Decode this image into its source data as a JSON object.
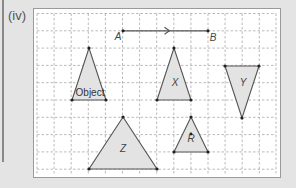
{
  "part_label": "(iv)",
  "colors": {
    "background": "#e4e4e4",
    "card": "#ffffff",
    "grid": "#a8a8a8",
    "shape_fill": "#e3e3e3",
    "shape_stroke": "#555555",
    "vertex": "#222222"
  },
  "grid": {
    "x0": 37,
    "y0": 13.5,
    "dx": 17.1,
    "dy": 17.3,
    "cols": 14,
    "rows": 9,
    "x_end": 276,
    "y_end": 175
  },
  "vector": {
    "start_label": "A",
    "end_label": "B",
    "start": [
      123,
      30.8
    ],
    "end": [
      208,
      30.8
    ]
  },
  "shapes": [
    {
      "name": "Object",
      "label": "Object",
      "points": [
        [
          89,
          48
        ],
        [
          72,
          100
        ],
        [
          106,
          100
        ]
      ],
      "label_pos": [
        90,
        96
      ],
      "italic": false
    },
    {
      "name": "X",
      "label": "X",
      "points": [
        [
          174,
          48
        ],
        [
          157,
          100
        ],
        [
          191,
          100
        ]
      ],
      "label_pos": [
        175,
        86
      ],
      "italic": true
    },
    {
      "name": "Y",
      "label": "Y",
      "points": [
        [
          225,
          66
        ],
        [
          259,
          66
        ],
        [
          242,
          118
        ]
      ],
      "label_pos": [
        243,
        86
      ],
      "italic": true
    },
    {
      "name": "Z",
      "label": "Z",
      "points": [
        [
          123,
          117
        ],
        [
          89,
          169
        ],
        [
          157,
          169
        ]
      ],
      "label_pos": [
        123,
        152
      ],
      "italic": true
    },
    {
      "name": "R",
      "label": "R",
      "points": [
        [
          191,
          117
        ],
        [
          174,
          152
        ],
        [
          208,
          152
        ]
      ],
      "label_pos": [
        191,
        142
      ],
      "italic": true
    }
  ],
  "extra_points": [
    [
      191,
      134
    ]
  ]
}
